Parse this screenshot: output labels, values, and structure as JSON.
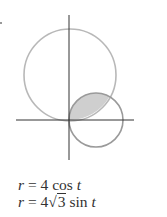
{
  "figure": {
    "axes": {
      "origin": [
        69,
        120
      ],
      "x_axis": {
        "from": 16,
        "to": 134
      },
      "y_axis": {
        "from": 15,
        "to": 160
      },
      "color": "#333333"
    },
    "curves": [
      {
        "name": "large-circle",
        "equation_ref": 1,
        "cx": 70,
        "cy": 75,
        "r": 46,
        "stroke": "#b5b5b5"
      },
      {
        "name": "small-circle",
        "equation_ref": 0,
        "cx": 96,
        "cy": 120,
        "r": 27,
        "stroke": "#9a9a9a"
      }
    ],
    "shaded_region": {
      "fill": "#cfcfcf",
      "stroke": "#9a9a9a"
    }
  },
  "equations": [
    {
      "lhs": "r",
      "eq": "=",
      "coef": "4",
      "func": "cos",
      "arg": "t"
    },
    {
      "lhs": "r",
      "eq": "=",
      "coef": "4",
      "sqrt": "3",
      "func": "sin",
      "arg": "t"
    }
  ]
}
